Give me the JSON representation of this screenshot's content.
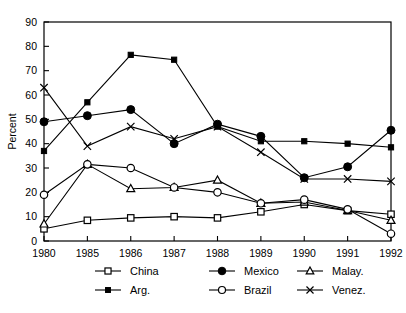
{
  "chart_data": {
    "type": "line",
    "title": "",
    "xlabel": "",
    "ylabel": "Percent",
    "categories": [
      "1980",
      "1985",
      "1986",
      "1987",
      "1988",
      "1989",
      "1990",
      "1991",
      "1992"
    ],
    "x": [
      1980,
      1985,
      1986,
      1987,
      1988,
      1989,
      1990,
      1991,
      1992
    ],
    "ylim": [
      0,
      90
    ],
    "yticks": [
      0,
      10,
      20,
      30,
      40,
      50,
      60,
      70,
      80,
      90
    ],
    "ytick_labels": [
      "0",
      "10",
      "20",
      "30",
      "40",
      "50",
      "60",
      "70",
      "80",
      "90"
    ],
    "xlim": [
      1980,
      1992
    ],
    "grid": false,
    "legend_position": "below-axes",
    "axis_spacing": "categorical-even",
    "series": [
      {
        "name": "China",
        "marker": "open-square",
        "values": [
          5.0,
          8.5,
          9.5,
          10.0,
          9.5,
          12.0,
          15.0,
          12.5,
          11.0
        ]
      },
      {
        "name": "Mexico",
        "marker": "filled-circle",
        "values": [
          49.0,
          51.5,
          54.0,
          40.0,
          48.0,
          43.0,
          26.0,
          30.5,
          45.5
        ]
      },
      {
        "name": "Malay.",
        "marker": "open-triangle",
        "values": [
          7.0,
          31.5,
          21.5,
          22.0,
          25.0,
          15.5,
          16.0,
          12.5,
          8.5
        ]
      },
      {
        "name": "Arg.",
        "marker": "filled-square",
        "values": [
          37.0,
          57.0,
          76.5,
          74.5,
          47.0,
          41.0,
          41.0,
          40.0,
          38.5
        ]
      },
      {
        "name": "Brazil",
        "marker": "open-circle",
        "values": [
          19.0,
          31.5,
          30.0,
          22.0,
          20.0,
          15.5,
          17.0,
          13.0,
          3.0
        ]
      },
      {
        "name": "Venez.",
        "marker": "cross-x",
        "values": [
          63.0,
          39.0,
          47.0,
          42.0,
          47.0,
          36.5,
          25.5,
          25.5,
          24.5
        ]
      }
    ]
  },
  "legend": {
    "entries": [
      {
        "label": "China",
        "marker": "open-square"
      },
      {
        "label": "Mexico",
        "marker": "filled-circle"
      },
      {
        "label": "Malay.",
        "marker": "open-triangle"
      },
      {
        "label": "Arg.",
        "marker": "filled-square"
      },
      {
        "label": "Brazil",
        "marker": "open-circle"
      },
      {
        "label": "Venez.",
        "marker": "cross-x"
      }
    ]
  },
  "colors": {
    "line": "#000000",
    "axis": "#000000",
    "background": "#ffffff",
    "marker_fill_open": "#ffffff"
  }
}
